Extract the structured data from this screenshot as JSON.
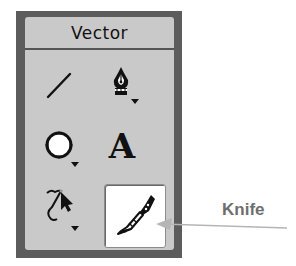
{
  "panel": {
    "title": "Vector",
    "tools": [
      {
        "id": "line",
        "icon": "line-icon",
        "has_flyout": false,
        "selected": false
      },
      {
        "id": "pen",
        "icon": "pen-icon",
        "has_flyout": true,
        "selected": false
      },
      {
        "id": "ellipse",
        "icon": "ellipse-icon",
        "has_flyout": true,
        "selected": false
      },
      {
        "id": "text",
        "icon": "text-icon",
        "label": "A",
        "has_flyout": false,
        "selected": false
      },
      {
        "id": "subselection",
        "icon": "subselection-icon",
        "has_flyout": true,
        "selected": false
      },
      {
        "id": "knife",
        "icon": "knife-icon",
        "has_flyout": false,
        "selected": true
      }
    ]
  },
  "callout": {
    "label": "Knife",
    "color": "#6e6e6e",
    "line_color": "#b5b5b5"
  },
  "colors": {
    "panel_border": "#5c5c5c",
    "panel_bg": "#c9c9c9",
    "selected_bg": "#ffffff",
    "icon": "#111111"
  }
}
